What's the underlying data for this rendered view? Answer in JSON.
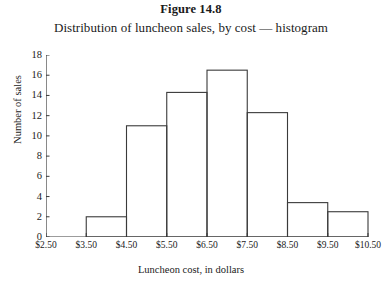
{
  "figure": {
    "number_label": "Figure 14.8",
    "caption": "Distribution of luncheon sales, by cost — histogram"
  },
  "chart_data": {
    "type": "bar",
    "title": "Distribution of luncheon sales, by cost — histogram",
    "xlabel": "Luncheon cost, in dollars",
    "ylabel": "Number of sales",
    "grid": false,
    "legend": false,
    "xlim": [
      2.5,
      10.5
    ],
    "ylim": [
      0,
      18
    ],
    "ytick_step": 2,
    "bin_width": 1.0,
    "xtick_labels": [
      "$2.50",
      "$3.50",
      "$4.50",
      "$5.50",
      "$6.50",
      "$7.50",
      "$8.50",
      "$9.50",
      "$10.50"
    ],
    "xtick_values": [
      2.5,
      3.5,
      4.5,
      5.5,
      6.5,
      7.5,
      8.5,
      9.5,
      10.5
    ],
    "ytick_labels": [
      "0",
      "2",
      "4",
      "6",
      "8",
      "10",
      "12",
      "14",
      "16",
      "18"
    ],
    "ytick_values": [
      0,
      2,
      4,
      6,
      8,
      10,
      12,
      14,
      16,
      18
    ],
    "bins": [
      {
        "range": "$2.50-$3.50",
        "x0": 2.5,
        "x1": 3.5,
        "value": 0
      },
      {
        "range": "$3.50-$4.50",
        "x0": 3.5,
        "x1": 4.5,
        "value": 2
      },
      {
        "range": "$4.50-$5.50",
        "x0": 4.5,
        "x1": 5.5,
        "value": 11
      },
      {
        "range": "$5.50-$6.50",
        "x0": 5.5,
        "x1": 6.5,
        "value": 14.3
      },
      {
        "range": "$6.50-$7.50",
        "x0": 6.5,
        "x1": 7.5,
        "value": 16.5
      },
      {
        "range": "$7.50-$8.50",
        "x0": 7.5,
        "x1": 8.5,
        "value": 12.3
      },
      {
        "range": "$8.50-$9.50",
        "x0": 8.5,
        "x1": 9.5,
        "value": 3.4
      },
      {
        "range": "$9.50-$10.50",
        "x0": 9.5,
        "x1": 10.5,
        "value": 2.5
      }
    ],
    "categories": [
      "$2.50-$3.50",
      "$3.50-$4.50",
      "$4.50-$5.50",
      "$5.50-$6.50",
      "$6.50-$7.50",
      "$7.50-$8.50",
      "$8.50-$9.50",
      "$9.50-$10.50"
    ],
    "values": [
      0,
      2,
      11,
      14.3,
      16.5,
      12.3,
      3.4,
      2.5
    ]
  },
  "style": {
    "line_color": "#3a3a3a",
    "text_color": "#1a1a1a",
    "background": "#ffffff"
  }
}
